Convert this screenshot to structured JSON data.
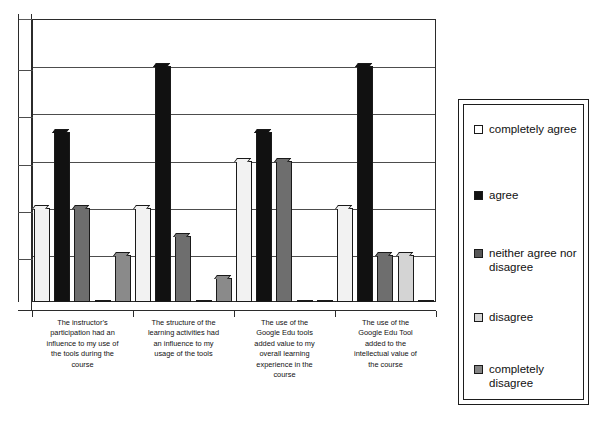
{
  "chart_data": {
    "type": "bar",
    "title": "",
    "subtitle": "",
    "xlabel": "",
    "ylabel": "",
    "grid": true,
    "legend_position": "right",
    "ylim": [
      0,
      6
    ],
    "gridline_count": 6,
    "categories": [
      "The instructor’s participation had an influence to my use of the tools during the course",
      "The structure of the learning activities had an influence to my usage of the tools",
      "The use of the Google Edu tools added value to my overall learning experience in the course",
      "The use of the Google Edu Tool added to the intellectual value of the course"
    ],
    "category_lines": [
      [
        "The instructor’s",
        "participation had an",
        "influence to my use of",
        "the tools during the",
        "course"
      ],
      [
        "The structure of the",
        "learning activities had",
        "an influence to my",
        "usage of the tools"
      ],
      [
        "The use of the",
        "Google Edu tools",
        "added value to my",
        "overall learning",
        "experience in the",
        "course"
      ],
      [
        "The use of the",
        "Google Edu Tool",
        "added to the",
        "intellectual value of",
        "the course"
      ]
    ],
    "series": [
      {
        "name": "completely agree",
        "color": "#f2f2f2",
        "values": [
          2,
          2,
          3,
          2
        ]
      },
      {
        "name": "agree",
        "color": "#111111",
        "values": [
          3.6,
          5,
          3.6,
          5
        ]
      },
      {
        "name": "neither agree nor disagree",
        "color": "#6e6e6e",
        "values": [
          2,
          1.4,
          3,
          1
        ]
      },
      {
        "name": "disagree",
        "color": "#d4d4d4",
        "values": [
          0,
          0,
          0,
          1
        ]
      },
      {
        "name": "completely disagree",
        "color": "#8a8a8a",
        "values": [
          1,
          0.5,
          0,
          0
        ]
      }
    ]
  },
  "legend": {
    "items": [
      {
        "label": "completely agree",
        "color": "#ffffff"
      },
      {
        "label": "agree",
        "color": "#111111"
      },
      {
        "label": "neither agree nor disagree",
        "color": "#575757"
      },
      {
        "label": "disagree",
        "color": "#d4d4d4"
      },
      {
        "label": "completely disagree",
        "color": "#848484"
      }
    ]
  }
}
